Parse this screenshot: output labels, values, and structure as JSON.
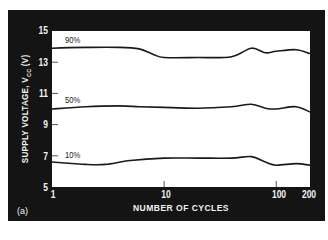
{
  "chart_data": {
    "type": "line",
    "title": "",
    "panel_label": "(a)",
    "xlabel": "NUMBER OF CYCLES",
    "ylabel": "SUPPLY VOLTAGE, V",
    "ylabel_sub": "CC",
    "ylabel_unit": " (V)",
    "xscale": "log",
    "xlim": [
      1,
      200
    ],
    "ylim": [
      5,
      15
    ],
    "x_ticks": [
      "1",
      "10",
      "100",
      "200"
    ],
    "y_ticks": [
      "5",
      "7",
      "9",
      "11",
      "13",
      "15"
    ],
    "grid": false,
    "legend": "inline labels",
    "series": [
      {
        "name": "90%",
        "x": [
          1,
          2,
          4,
          6,
          8,
          10,
          20,
          40,
          60,
          80,
          100,
          150,
          200
        ],
        "values": [
          13.9,
          13.95,
          13.95,
          13.85,
          13.5,
          13.3,
          13.3,
          13.35,
          13.9,
          13.6,
          13.7,
          13.8,
          13.55
        ]
      },
      {
        "name": "50%",
        "x": [
          1,
          2,
          4,
          6,
          10,
          20,
          40,
          60,
          80,
          100,
          150,
          200
        ],
        "values": [
          10.0,
          10.15,
          10.2,
          10.15,
          10.1,
          10.05,
          10.15,
          10.3,
          10.05,
          10.0,
          10.15,
          9.8
        ]
      },
      {
        "name": "10%",
        "x": [
          1,
          2,
          3,
          5,
          10,
          20,
          40,
          60,
          80,
          100,
          150,
          200
        ],
        "values": [
          6.6,
          6.45,
          6.45,
          6.7,
          6.85,
          6.85,
          6.85,
          6.95,
          6.6,
          6.4,
          6.5,
          6.4
        ]
      }
    ]
  }
}
